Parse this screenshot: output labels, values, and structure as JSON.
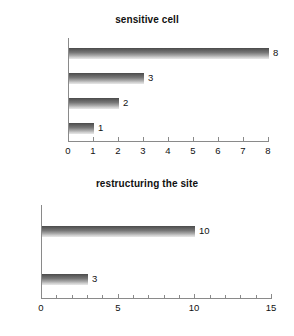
{
  "chart_data": [
    {
      "type": "bar",
      "orientation": "horizontal",
      "title": "sensitive cell",
      "categories": [
        "(n-k) rule",
        "p-percent",
        "pq rule",
        "other"
      ],
      "values": [
        8,
        3,
        2,
        1
      ],
      "value_labels": [
        "8",
        "3",
        "2",
        "1"
      ],
      "xlabel": "",
      "ylabel": "",
      "xlim": [
        0,
        8
      ],
      "xticks": [
        0,
        1,
        2,
        3,
        4,
        5,
        6,
        7,
        8
      ],
      "xtick_labels": [
        "0",
        "1",
        "2",
        "3",
        "4",
        "5",
        "6",
        "7",
        "8"
      ],
      "grid": false,
      "legend": false,
      "bar_color": "#787878"
    },
    {
      "type": "bar",
      "orientation": "horizontal",
      "title": "restructuring the site",
      "categories": [
        "Yes",
        "No"
      ],
      "values": [
        10,
        3
      ],
      "value_labels": [
        "10",
        "3"
      ],
      "xlabel": "",
      "ylabel": "",
      "xlim": [
        0,
        15
      ],
      "xticks": [
        0,
        1,
        2,
        3,
        4,
        5,
        6,
        7,
        8,
        9,
        10,
        11,
        12,
        13,
        14,
        15
      ],
      "xtick_labels": [
        "0",
        "",
        "",
        "",
        "",
        "5",
        "",
        "",
        "",
        "",
        "10",
        "",
        "",
        "",
        "",
        "15"
      ],
      "grid": false,
      "legend": false,
      "bar_color": "#787878"
    }
  ]
}
